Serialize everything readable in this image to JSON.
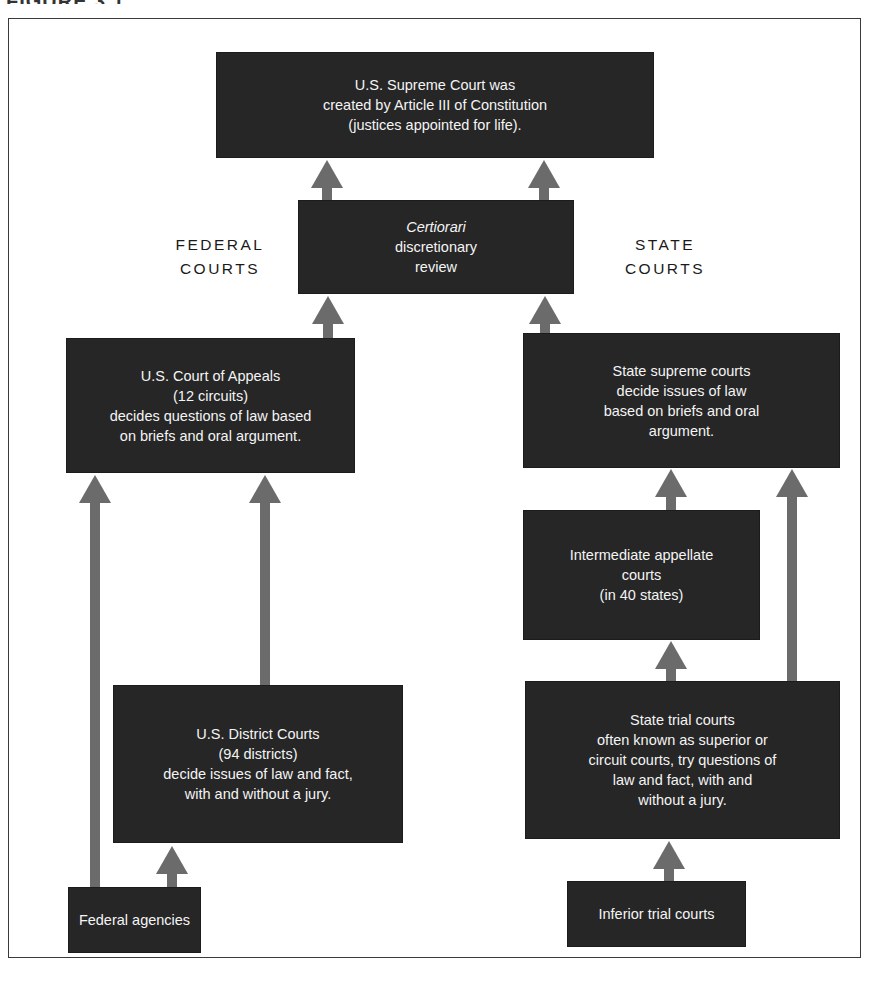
{
  "figure": {
    "heading_fragment": "FIGURE 3.1"
  },
  "labels": {
    "federal": [
      "FEDERAL",
      "COURTS"
    ],
    "state": [
      "STATE",
      "COURTS"
    ]
  },
  "boxes": {
    "supreme_court": [
      "U.S. Supreme Court was",
      "created by Article III of Constitution",
      "(justices appointed for life)."
    ],
    "certiorari": [
      "Certiorari",
      "discretionary",
      "review"
    ],
    "court_of_appeals": [
      "U.S. Court of Appeals",
      "(12 circuits)",
      "decides questions of law based",
      "on briefs and oral argument."
    ],
    "state_supreme": [
      "State supreme courts",
      "decide issues of law",
      "based on briefs and oral",
      "argument."
    ],
    "intermediate_appellate": [
      "Intermediate appellate",
      "courts",
      "(in 40 states)"
    ],
    "district_courts": [
      "U.S. District Courts",
      "(94 districts)",
      "decide issues of law and fact,",
      "with and without a jury."
    ],
    "state_trial": [
      "State trial courts",
      "often known as superior or",
      "circuit courts, try questions of",
      "law and fact, with and",
      "without a jury."
    ],
    "federal_agencies": [
      "Federal agencies"
    ],
    "inferior_trial": [
      "Inferior trial courts"
    ]
  },
  "colors": {
    "box_fill": "#262626",
    "box_text": "#f4f4f4",
    "arrow": "#6b6b6b",
    "frame": "#3a3a3a"
  }
}
